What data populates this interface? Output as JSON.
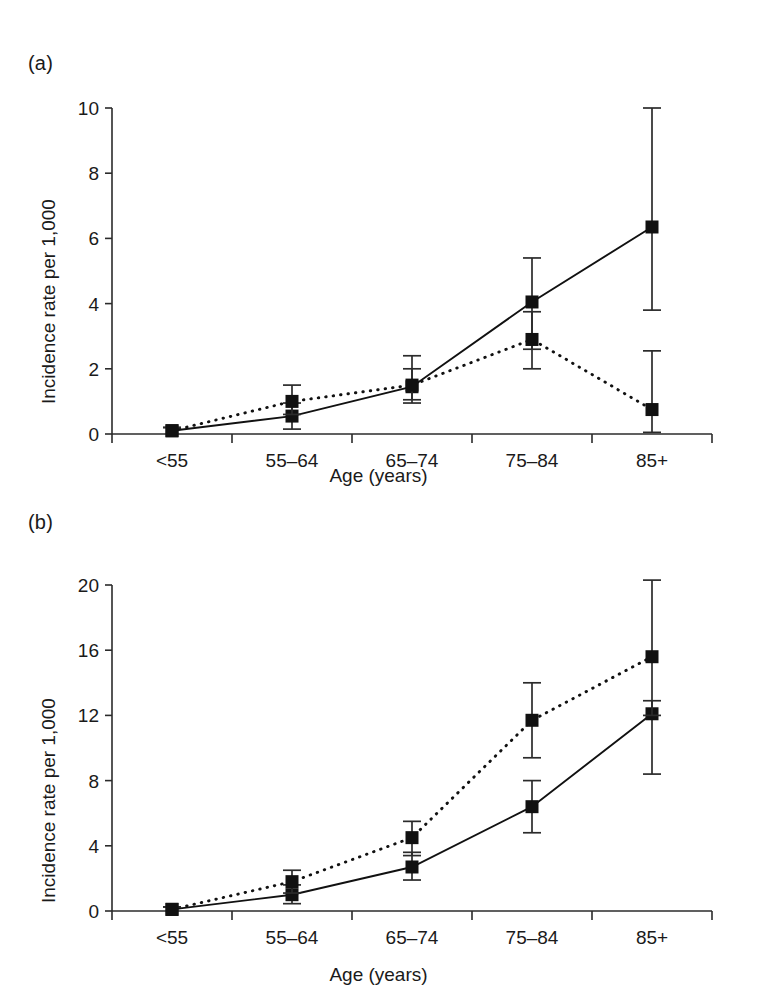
{
  "figure": {
    "panels": [
      {
        "tag": "(a)",
        "xlabel": "Age (years)",
        "ylabel": "Incidence rate per 1,000"
      },
      {
        "tag": "(b)",
        "xlabel": "Age (years)",
        "ylabel": "Incidence rate per 1,000"
      }
    ]
  },
  "chart_data": [
    {
      "type": "line",
      "panel": "(a)",
      "title": "",
      "xlabel": "Age (years)",
      "ylabel": "Incidence rate per 1,000",
      "categories": [
        "<55",
        "55–64",
        "65–74",
        "75–84",
        "85+"
      ],
      "ylim": [
        0,
        10
      ],
      "yticks": [
        0,
        2,
        4,
        6,
        8,
        10
      ],
      "yticklabels": [
        "0",
        "2",
        "4",
        "6",
        "8",
        "10"
      ],
      "grid": false,
      "legend": "none",
      "series": [
        {
          "name": "solid-line-series",
          "style": "solid",
          "marker": "filled-square",
          "values": [
            0.1,
            0.55,
            1.45,
            4.05,
            6.35
          ],
          "err_low": [
            0.0,
            0.15,
            0.95,
            2.6,
            3.8
          ],
          "err_high": [
            0.2,
            0.95,
            2.0,
            5.4,
            10.0
          ]
        },
        {
          "name": "dotted-line-series",
          "style": "dotted",
          "marker": "filled-square",
          "values": [
            0.1,
            1.0,
            1.5,
            2.9,
            0.75
          ],
          "err_low": [
            0.0,
            0.6,
            1.05,
            2.0,
            0.05
          ],
          "err_high": [
            0.2,
            1.5,
            2.4,
            3.75,
            2.55
          ]
        }
      ]
    },
    {
      "type": "line",
      "panel": "(b)",
      "title": "",
      "xlabel": "Age (years)",
      "ylabel": "Incidence rate per 1,000",
      "categories": [
        "<55",
        "55–64",
        "65–74",
        "75–84",
        "85+"
      ],
      "ylim": [
        0,
        20
      ],
      "yticks": [
        0,
        4,
        8,
        12,
        16,
        20
      ],
      "yticklabels": [
        "0",
        "4",
        "8",
        "12",
        "16",
        "20"
      ],
      "grid": false,
      "legend": "none",
      "series": [
        {
          "name": "solid-line-series",
          "style": "solid",
          "marker": "filled-square",
          "values": [
            0.1,
            1.0,
            2.7,
            6.4,
            12.1
          ],
          "err_low": [
            0.0,
            0.45,
            1.9,
            4.8,
            8.4
          ],
          "err_high": [
            0.25,
            1.6,
            3.6,
            8.0,
            12.9
          ]
        },
        {
          "name": "dotted-line-series",
          "style": "dotted",
          "marker": "filled-square",
          "values": [
            0.1,
            1.8,
            4.5,
            11.7,
            15.6
          ],
          "err_low": [
            0.0,
            1.1,
            3.4,
            9.4,
            12.0
          ],
          "err_high": [
            0.25,
            2.5,
            5.5,
            14.0,
            20.3
          ]
        }
      ]
    }
  ]
}
